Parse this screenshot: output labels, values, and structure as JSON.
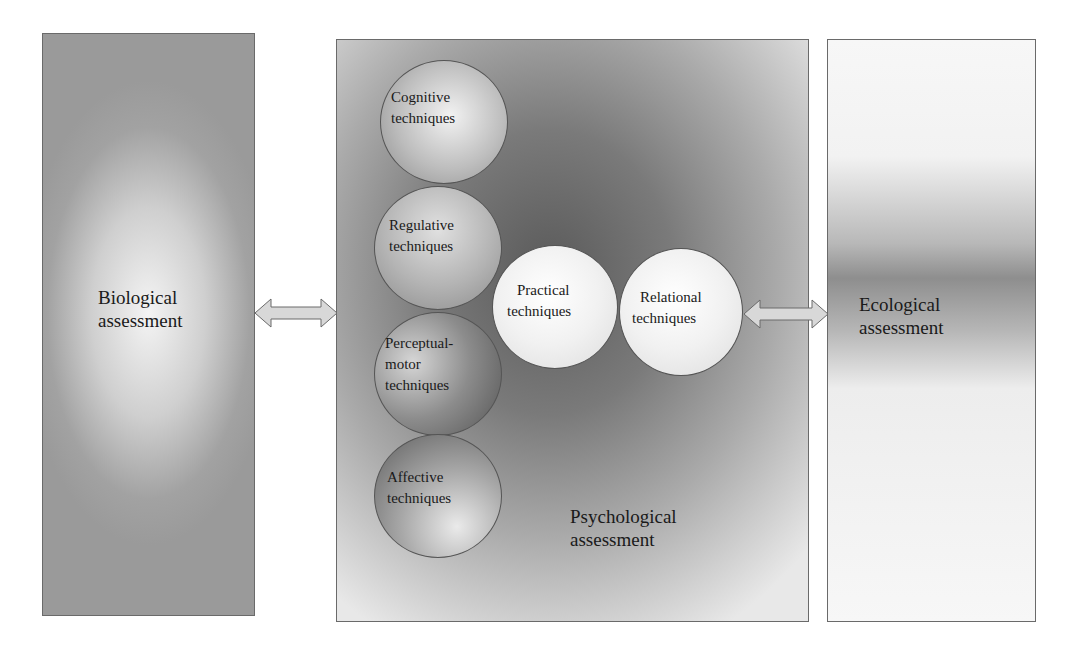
{
  "diagram": {
    "boxes": {
      "biological": {
        "label_line1": "Biological",
        "label_line2": "assessment"
      },
      "psychological": {
        "label_line1": "Psychological",
        "label_line2": "assessment"
      },
      "ecological": {
        "label_line1": "Ecological",
        "label_line2": "assessment"
      }
    },
    "techniques": [
      {
        "line1": "Cognitive",
        "line2": "techniques"
      },
      {
        "line1": "Regulative",
        "line2": "techniques"
      },
      {
        "line1": "Perceptual-",
        "line2": "motor",
        "line3": "techniques"
      },
      {
        "line1": "Affective",
        "line2": "techniques"
      },
      {
        "line1": "Practical",
        "line2": "techniques"
      },
      {
        "line1": "Relational",
        "line2": "techniques"
      }
    ],
    "arrows": [
      {
        "from": "Biological assessment",
        "to": "Psychological assessment",
        "type": "bidirectional"
      },
      {
        "from": "Relational techniques",
        "to": "Ecological assessment",
        "type": "bidirectional"
      }
    ]
  }
}
